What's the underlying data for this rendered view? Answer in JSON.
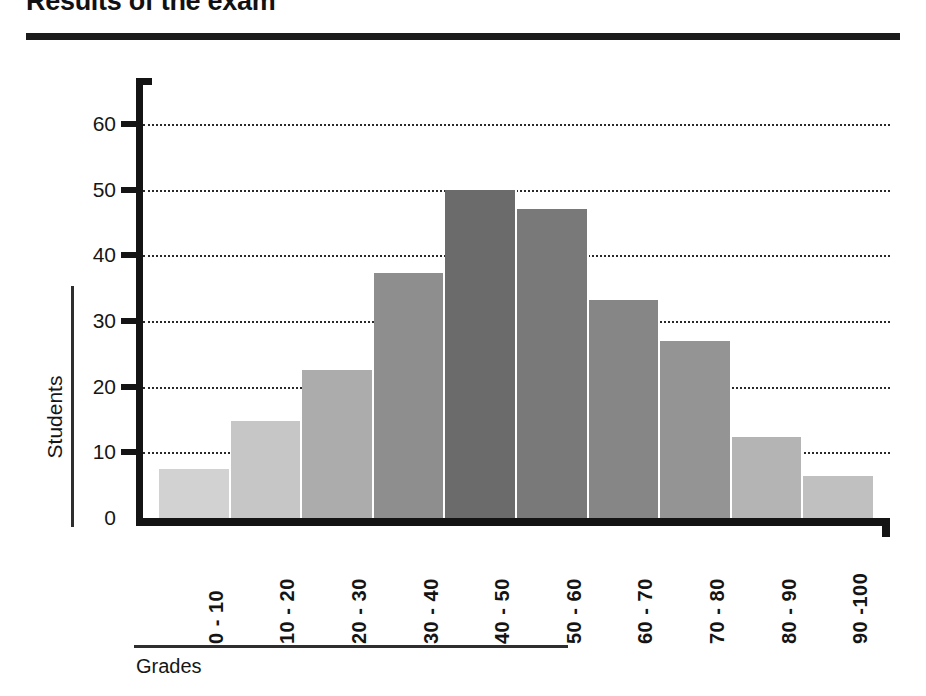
{
  "title": "Results of the exam",
  "axis": {
    "y_title": "Students",
    "x_title": "Grades"
  },
  "chart_data": {
    "type": "bar",
    "title": "Results of the exam",
    "xlabel": "Grades",
    "ylabel": "Students",
    "categories": [
      "0 - 10",
      "10 - 20",
      "20 - 30",
      "30 - 40",
      "40 - 50",
      "50 - 60",
      "60 - 70",
      "70 - 80",
      "80 - 90",
      "90 -100"
    ],
    "values": [
      7.5,
      14.8,
      22.5,
      37.3,
      50,
      47,
      33.2,
      27,
      12.3,
      6.4
    ],
    "ylim": [
      0,
      67
    ],
    "yticks": [
      0,
      10,
      20,
      30,
      40,
      50,
      60
    ],
    "ytick_labels": [
      "0",
      "10",
      "20",
      "30",
      "40",
      "50",
      "60"
    ],
    "grid": "horizontal-dotted",
    "legend": "none",
    "bar_colors": [
      "#d2d2d2",
      "#c6c6c6",
      "#acacac",
      "#8e8e8e",
      "#6b6b6b",
      "#797979",
      "#868686",
      "#949494",
      "#b4b4b4",
      "#c0c0c0"
    ]
  }
}
